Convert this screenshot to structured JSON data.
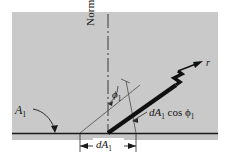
{
  "figure": {
    "background_color": "#c9c9c9",
    "line_color": "#1a1a1a",
    "page_color": "#ffffff",
    "labels": {
      "normal": "Normal",
      "surface_area": "A",
      "surface_area_sub": "1",
      "angle": "ϕ",
      "angle_sub": "1",
      "projected_prefix": "dA",
      "projected_sub": "1",
      "projected_suffix": " cos ϕ",
      "projected_suffix_sub": "1",
      "differential_area": "dA",
      "differential_area_sub": "1",
      "ray": "r"
    },
    "elements": {
      "panel": "gray-background-panel",
      "baseline": "horizontal-surface-line",
      "normal_line": "vertical-normal-dash-dot-line",
      "ray_bar": "thick-slanted-ray-bar",
      "break_mark": "zigzag-break-mark",
      "angle_arc": "phi-angle-arc",
      "projection_line": "perpendicular-projection-line",
      "hypotenuse": "thin-inclined-construction-line",
      "dimension_line": "da1-dimension-line",
      "callout_arrow": "a1-curved-callout-arrow",
      "leader_line": "projected-area-leader-line"
    },
    "geometry": {
      "panel_rect": [
        12,
        12,
        206,
        128
      ],
      "baseline_y": 133,
      "normal_x": 108,
      "ray_start": [
        108,
        133
      ],
      "ray_end": [
        199,
        69
      ],
      "angle_degrees": 35
    }
  }
}
